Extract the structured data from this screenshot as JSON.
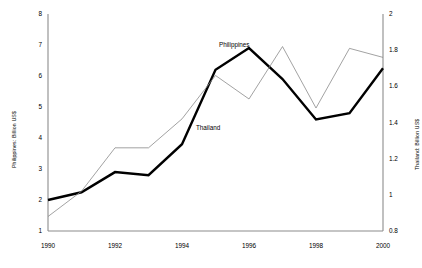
{
  "chart_data": {
    "type": "line",
    "title": "",
    "xlabel": "",
    "x": [
      1990,
      1991,
      1992,
      1993,
      1994,
      1995,
      1996,
      1997,
      1998,
      1999,
      2000
    ],
    "xtick_labels": [
      "1990",
      "1992",
      "1994",
      "1996",
      "1998",
      "2000"
    ],
    "xtick_values": [
      1990,
      1992,
      1994,
      1996,
      1998,
      2000
    ],
    "xlim": [
      1990,
      2000
    ],
    "grid": false,
    "legend_position": "inline-annotation",
    "axes": {
      "left": {
        "label": "Philippines: Billion US$",
        "ylim": [
          1,
          8
        ],
        "ticks": [
          1,
          2,
          3,
          4,
          5,
          6,
          7,
          8
        ],
        "tick_labels": [
          "1",
          "2",
          "3",
          "4",
          "5",
          "6",
          "7",
          "8"
        ]
      },
      "right": {
        "label": "Thailand: Billion US$",
        "ylim": [
          0.8,
          2
        ],
        "ticks": [
          0.8,
          1,
          1.2,
          1.4,
          1.6,
          1.8,
          2
        ],
        "tick_labels": [
          "0.8",
          "1",
          "1.2",
          "1.4",
          "1.6",
          "1.8",
          "2"
        ]
      }
    },
    "series": [
      {
        "name": "Philippines",
        "axis": "left",
        "color": "#000000",
        "line_width": 2.4,
        "annotation": "Philippines",
        "values": [
          2.0,
          2.25,
          2.9,
          2.8,
          3.8,
          6.2,
          6.9,
          5.9,
          4.6,
          4.8,
          6.25
        ]
      },
      {
        "name": "Thailand",
        "axis": "right",
        "color": "#8a8a8a",
        "line_width": 0.8,
        "annotation": "Thailand",
        "values": [
          0.88,
          1.02,
          1.26,
          1.26,
          1.42,
          1.66,
          1.53,
          1.82,
          1.48,
          1.81,
          1.76
        ]
      }
    ]
  },
  "colors": {
    "axis": "#8c8c8c",
    "philippines": "#000000",
    "thailand": "#8a8a8a",
    "background": "#ffffff"
  }
}
